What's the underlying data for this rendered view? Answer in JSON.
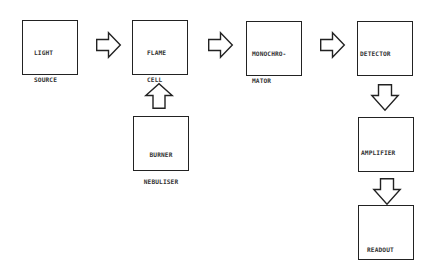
{
  "diagram": {
    "type": "block-flow",
    "nodes": [
      {
        "id": "light-source",
        "lines": [
          "LIGHT",
          "SOURCE"
        ]
      },
      {
        "id": "flame-cell",
        "lines": [
          "FLAME",
          "CELL"
        ]
      },
      {
        "id": "monochromator",
        "lines": [
          "MONOCHRO-",
          "MATOR"
        ]
      },
      {
        "id": "detector",
        "lines": [
          "DETECTOR"
        ]
      },
      {
        "id": "burner-nebuliser",
        "lines": [
          "BURNER",
          "NEBULISER"
        ]
      },
      {
        "id": "amplifier",
        "lines": [
          "AMPLIFIER"
        ]
      },
      {
        "id": "readout",
        "lines": [
          "READOUT"
        ]
      }
    ],
    "edges": [
      {
        "from": "light-source",
        "to": "flame-cell",
        "direction": "right"
      },
      {
        "from": "flame-cell",
        "to": "monochromator",
        "direction": "right"
      },
      {
        "from": "monochromator",
        "to": "detector",
        "direction": "right"
      },
      {
        "from": "burner-nebuliser",
        "to": "flame-cell",
        "direction": "up"
      },
      {
        "from": "detector",
        "to": "amplifier",
        "direction": "down"
      },
      {
        "from": "amplifier",
        "to": "readout",
        "direction": "down"
      }
    ]
  }
}
